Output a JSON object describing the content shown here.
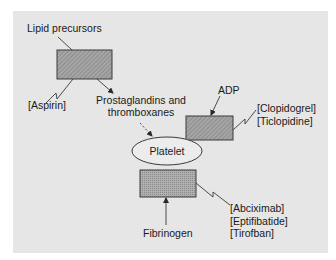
{
  "diagram": {
    "colors": {
      "panel_bg": "#e6e6e6",
      "box_fill": "#9a9a9a",
      "stroke": "#3a3a3a",
      "ellipse_fill": "#ececec",
      "text": "#1a1a1a"
    },
    "nodes": {
      "lipid_precursors": "Lipid precursors",
      "cox_box": "",
      "prostaglandins_line1": "Prostaglandins and",
      "prostaglandins_line2": "thromboxanes",
      "adp": "ADP",
      "adp_receptor_box": "",
      "platelet": "Platelet",
      "gp_receptor_box": "",
      "fibrinogen": "Fibrinogen"
    },
    "drugs": {
      "cox_inhibitors": [
        "[Aspirin]"
      ],
      "adp_inhibitors": [
        "[Clopidogrel]",
        "[Ticlopidine]"
      ],
      "gp_inhibitors": [
        "[Abciximab]",
        "[Eptifibatide]",
        "[Tirofban]"
      ]
    },
    "edges": [
      {
        "from": "Lipid precursors",
        "to": "box-1",
        "style": "line"
      },
      {
        "from": "box-1",
        "to": "Prostaglandins and thromboxanes",
        "style": "arrow"
      },
      {
        "from": "Prostaglandins and thromboxanes",
        "to": "Platelet",
        "style": "dashed-arrow"
      },
      {
        "from": "ADP",
        "to": "box-2",
        "style": "arrow"
      },
      {
        "from": "Fibrinogen",
        "to": "box-3",
        "style": "arrow"
      },
      {
        "from": "[Aspirin]",
        "to": "box-1",
        "style": "inhibition-zigzag"
      },
      {
        "from": "[Clopidogrel] [Ticlopidine]",
        "to": "box-2",
        "style": "inhibition-zigzag"
      },
      {
        "from": "[Abciximab] [Eptifibatide] [Tirofban]",
        "to": "box-3",
        "style": "inhibition-zigzag"
      }
    ]
  }
}
